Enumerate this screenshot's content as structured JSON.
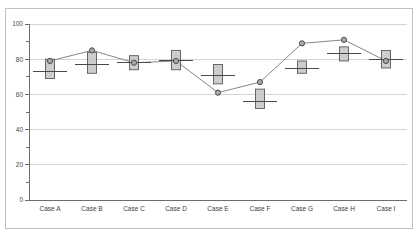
{
  "chart_data": {
    "type": "bar",
    "subtype": "box-plot-with-overlay-line",
    "title": "",
    "subtitle": "",
    "xlabel": "",
    "ylabel": "",
    "categories": [
      "Case A",
      "Case B",
      "Case C",
      "Case D",
      "Case E",
      "Case F",
      "Case G",
      "Case H",
      "Case I"
    ],
    "ylim": [
      0,
      100
    ],
    "xlim": [
      0,
      9
    ],
    "y_ticks_major": [
      0,
      20,
      40,
      60,
      80,
      100
    ],
    "y_tick_labels": [
      "0",
      "20",
      "40",
      "60",
      "80",
      "100"
    ],
    "y_ticks_minor": [
      10,
      30,
      50,
      70,
      90
    ],
    "grid": "horizontal",
    "legend": "none",
    "legend_position": "none",
    "boxes": [
      {
        "category": "Case A",
        "box_low": 69,
        "box_high": 80,
        "median": 73
      },
      {
        "category": "Case B",
        "box_low": 72,
        "box_high": 84,
        "median": 77
      },
      {
        "category": "Case C",
        "box_low": 74,
        "box_high": 82,
        "median": 78
      },
      {
        "category": "Case D",
        "box_low": 74,
        "box_high": 85,
        "median": 79
      },
      {
        "category": "Case E",
        "box_low": 66,
        "box_high": 77,
        "median": 71
      },
      {
        "category": "Case F",
        "box_low": 52,
        "box_high": 63,
        "median": 56
      },
      {
        "category": "Case G",
        "box_low": 72,
        "box_high": 79,
        "median": 75
      },
      {
        "category": "Case H",
        "box_low": 79,
        "box_high": 87,
        "median": 83
      },
      {
        "category": "Case I",
        "box_low": 75,
        "box_high": 85,
        "median": 80
      }
    ],
    "series": [
      {
        "name": "marker-series",
        "values": [
          79,
          85,
          78,
          79,
          61,
          67,
          89,
          91,
          79
        ]
      }
    ],
    "colors": {
      "box_fill": "#c4c4c4",
      "box_stroke": "#5a5a5a",
      "median_line": "#4a4a4a",
      "series_line": "#777777",
      "series_marker_fill": "#a8a8a8",
      "series_marker_stroke": "#4d4d4d",
      "gridline": "#c9c9c9",
      "axis": "#6e6e6e",
      "frame": "#b8b8b8",
      "background": "#ffffff"
    }
  }
}
